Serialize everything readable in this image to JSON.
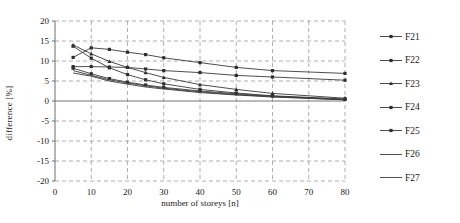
{
  "chart_data": {
    "type": "line",
    "title": "",
    "xlabel": "number of storeys [n]",
    "ylabel": "difference [%]",
    "xlim": [
      0,
      80
    ],
    "ylim": [
      -20,
      20
    ],
    "xticks": [
      0,
      10,
      20,
      30,
      40,
      50,
      60,
      70,
      80
    ],
    "yticks": [
      20,
      15,
      10,
      5,
      0,
      -5,
      -10,
      -15,
      -20
    ],
    "grid": true,
    "grid_style": "dashed",
    "legend_position": "right",
    "x": [
      5,
      10,
      15,
      20,
      25,
      30,
      40,
      50,
      60,
      80
    ],
    "series": [
      {
        "name": "F21",
        "color": "#3a3a3a",
        "marker": "square",
        "values": [
          10.9,
          13.3,
          12.9,
          12.2,
          11.6,
          10.8,
          9.6,
          8.4,
          7.6,
          6.9
        ]
      },
      {
        "name": "F22",
        "color": "#3a3a3a",
        "marker": "square",
        "values": [
          8.6,
          8.6,
          8.5,
          8.4,
          8.0,
          7.6,
          7.1,
          6.4,
          6.0,
          5.2
        ]
      },
      {
        "name": "F23",
        "color": "#3a3a3a",
        "marker": "triangle",
        "values": [
          14.0,
          11.8,
          9.9,
          8.4,
          7.1,
          5.9,
          4.1,
          2.9,
          1.9,
          0.7
        ]
      },
      {
        "name": "F24",
        "color": "#3a3a3a",
        "marker": "square",
        "values": [
          13.7,
          10.7,
          8.3,
          6.6,
          5.3,
          4.3,
          2.9,
          2.0,
          1.3,
          0.5
        ]
      },
      {
        "name": "F25",
        "color": "#3a3a3a",
        "marker": "square",
        "values": [
          8.2,
          6.8,
          5.6,
          4.7,
          4.0,
          3.4,
          2.5,
          1.8,
          1.2,
          0.4
        ]
      },
      {
        "name": "F26",
        "color": "#3a3a3a",
        "marker": "none",
        "values": [
          7.6,
          6.4,
          5.3,
          4.5,
          3.8,
          3.2,
          2.3,
          1.6,
          1.1,
          0.3
        ]
      },
      {
        "name": "F27",
        "color": "#3a3a3a",
        "marker": "none",
        "values": [
          7.0,
          6.2,
          5.0,
          4.2,
          3.5,
          3.0,
          2.1,
          1.5,
          1.0,
          0.3
        ]
      }
    ]
  },
  "axes": {
    "ylabel": "difference [%]",
    "xlabel": "number of storeys [n]",
    "yticks": [
      "20",
      "15",
      "10",
      "5",
      "0",
      "-5",
      "-10",
      "-15",
      "-20"
    ],
    "xticks": [
      "0",
      "10",
      "20",
      "30",
      "40",
      "50",
      "60",
      "70",
      "80"
    ]
  },
  "legend": {
    "items": [
      {
        "label": "F21"
      },
      {
        "label": "F22"
      },
      {
        "label": "F23"
      },
      {
        "label": "F24"
      },
      {
        "label": "F25"
      },
      {
        "label": "F26"
      },
      {
        "label": "F27"
      }
    ]
  },
  "colors": {
    "series": "#3a3a3a",
    "grid": "#9a9a9a",
    "axis": "#6e6e6e",
    "background": "#ffffff"
  }
}
